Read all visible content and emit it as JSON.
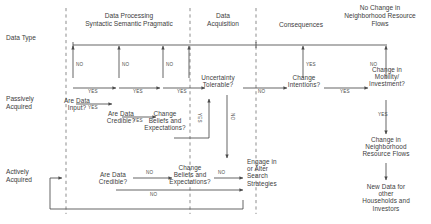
{
  "diagram": {
    "column_headers": [
      {
        "id": "data-type",
        "text": "Data Type"
      },
      {
        "id": "data-processing",
        "line1": "Data Processing",
        "line2": "Syntactic Semantic Pragmatic"
      },
      {
        "id": "data-acquisition",
        "line1": "Data",
        "line2": "Acquisition"
      },
      {
        "id": "consequences",
        "line1": "Consequences",
        "line2": ""
      },
      {
        "id": "no-change-flows",
        "line1": "No Change in",
        "line2": "Neighborhood Resource",
        "line3": "Flows"
      }
    ],
    "row_labels": [
      {
        "id": "passively-acquired",
        "line1": "Passively",
        "line2": "Acquired"
      },
      {
        "id": "actively-acquired",
        "line1": "Actively",
        "line2": "Acquired"
      }
    ],
    "nodes": [
      {
        "id": "are-data-input",
        "line1": "Are Data",
        "line2": "Input?"
      },
      {
        "id": "are-data-credible-passive",
        "line1": "Are Data",
        "line2": "Credible?"
      },
      {
        "id": "change-beliefs-passive",
        "line1": "Change",
        "line2": "Beliefs and",
        "line3": "Expectations?"
      },
      {
        "id": "uncertainty-tolerable",
        "line1": "Uncertainty",
        "line2": "Tolerable?"
      },
      {
        "id": "change-intentions",
        "line1": "Change",
        "line2": "Intentions?"
      },
      {
        "id": "change-mobility-investment",
        "line1": "Change in",
        "line2": "Mobility/",
        "line3": "Investment?"
      },
      {
        "id": "are-data-credible-active",
        "line1": "Are Data",
        "line2": "Credible?"
      },
      {
        "id": "change-beliefs-active",
        "line1": "Change",
        "line2": "Beliefs and",
        "line3": "Expectations?"
      },
      {
        "id": "engage-alter-search",
        "line1": "Engage in",
        "line2": "or Alter",
        "line3": "Search",
        "line4": "Strategies"
      },
      {
        "id": "change-neighborhood-flows",
        "line1": "Change in",
        "line2": "Neighborhood",
        "line3": "Resource Flows"
      },
      {
        "id": "new-data",
        "line1": "New Data for",
        "line2": "other",
        "line3": "Households and",
        "line4": "Investors"
      }
    ],
    "edge_labels": {
      "no": "NO",
      "yes": "YES"
    },
    "edges": [
      {
        "from": "are-data-input",
        "label": "NO",
        "to": "no-change-flows-line"
      },
      {
        "from": "are-data-input",
        "label": "YES",
        "to": "are-data-credible-passive"
      },
      {
        "from": "are-data-credible-passive",
        "label": "NO",
        "to": "no-change-flows-line"
      },
      {
        "from": "are-data-credible-passive",
        "label": "YES",
        "to": "change-beliefs-passive"
      },
      {
        "from": "change-beliefs-passive",
        "label": "NO",
        "to": "no-change-flows-line"
      },
      {
        "from": "change-beliefs-passive",
        "label": "YES",
        "to": "uncertainty-tolerable"
      },
      {
        "from": "uncertainty-tolerable",
        "label": "NO",
        "to": "engage-alter-search"
      },
      {
        "from": "uncertainty-tolerable",
        "label": "YES",
        "to": "change-intentions"
      },
      {
        "from": "change-intentions",
        "label": "NO",
        "to": "no-change-flows-line"
      },
      {
        "from": "change-intentions",
        "label": "YES",
        "to": "change-mobility-investment"
      },
      {
        "from": "change-mobility-investment",
        "label": "NO",
        "to": "no-change-flows-line"
      },
      {
        "from": "change-mobility-investment",
        "label": "YES",
        "to": "change-neighborhood-flows"
      },
      {
        "from": "change-neighborhood-flows",
        "label": "",
        "to": "new-data"
      },
      {
        "from": "are-data-credible-active",
        "label": "YES",
        "to": "change-beliefs-active"
      },
      {
        "from": "are-data-credible-active",
        "label": "NO",
        "to": "engage-alter-search"
      },
      {
        "from": "change-beliefs-active",
        "label": "NO",
        "to": "engage-alter-search"
      },
      {
        "from": "engage-alter-search",
        "label": "",
        "to": "are-data-credible-active"
      }
    ],
    "yes_no_marks": [
      {
        "id": "no-1",
        "text": "NO"
      },
      {
        "id": "yes-1",
        "text": "YES"
      },
      {
        "id": "no-2",
        "text": "NO"
      },
      {
        "id": "yes-2",
        "text": "YES"
      },
      {
        "id": "no-3",
        "text": "NO"
      },
      {
        "id": "yes-3",
        "text": "YES"
      },
      {
        "id": "yes-4",
        "text": "YES"
      },
      {
        "id": "yes-5",
        "text": "YES"
      },
      {
        "id": "no-4",
        "text": "NO"
      },
      {
        "id": "yes-6",
        "text": "YES"
      },
      {
        "id": "no-5",
        "text": "NO"
      },
      {
        "id": "yes-7",
        "text": "YES"
      },
      {
        "id": "yes-8",
        "text": "YES"
      },
      {
        "id": "no-6",
        "text": "NO"
      },
      {
        "id": "yes-9",
        "text": "YES"
      },
      {
        "id": "no-7",
        "text": "NO"
      },
      {
        "id": "no-8",
        "text": "NO"
      }
    ],
    "colors": {
      "line": "#4a4a4a",
      "divider": "#8d8d8d",
      "text": "#3d3d3d",
      "background": "#ffffff"
    }
  }
}
